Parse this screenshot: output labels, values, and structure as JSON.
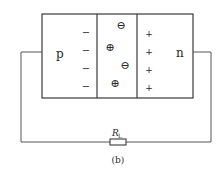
{
  "diagram": {
    "caption": "(b)",
    "regions": {
      "p_label": "p",
      "n_label": "n"
    },
    "p_side_charges": [
      "−",
      "−",
      "−",
      "−"
    ],
    "n_side_charges": [
      "+",
      "+",
      "+",
      "+"
    ],
    "depletion_ions": [
      {
        "symbol": "⊖",
        "x": 121,
        "y": 25
      },
      {
        "symbol": "⊕",
        "x": 110,
        "y": 47
      },
      {
        "symbol": "⊖",
        "x": 125,
        "y": 65
      },
      {
        "symbol": "⊕",
        "x": 115,
        "y": 83
      }
    ],
    "resistor": {
      "label_main": "R",
      "label_sub": "L"
    },
    "colors": {
      "line": "#3a3a3a",
      "text": "#2a2a2a"
    }
  }
}
